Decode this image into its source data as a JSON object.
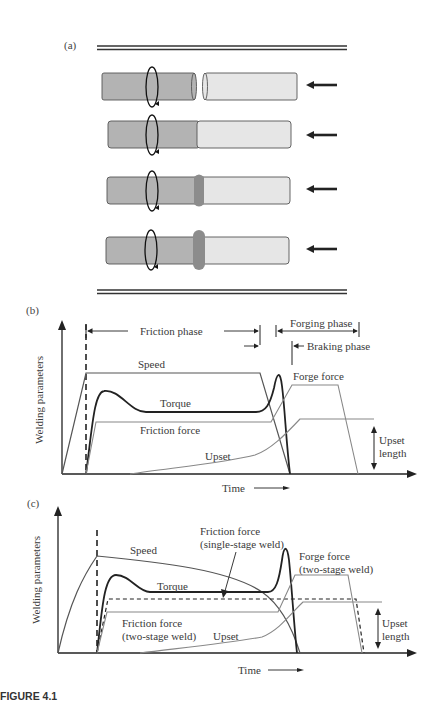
{
  "figure": {
    "caption": "FIGURE 4.1"
  },
  "panel_a": {
    "label": "(a)",
    "stages": [
      {
        "stage": 1,
        "description": "rods separated, left rotating, right pushed"
      },
      {
        "stage": 2,
        "description": "rods in contact"
      },
      {
        "stage": 3,
        "description": "flash forming at interface"
      },
      {
        "stage": 4,
        "description": "larger flash at interface"
      }
    ],
    "colors": {
      "rotating_rod": "#b3b3b3",
      "stationary_rod": "#e6e6e6",
      "flash": "#8c8c8c"
    }
  },
  "panel_b": {
    "label": "(b)",
    "ylabel": "Welding parameters",
    "xlabel": "Time",
    "phases": {
      "friction": "Friction phase",
      "forging": "Forging phase",
      "braking": "Braking phase"
    },
    "curves": {
      "speed": "Speed",
      "torque": "Torque",
      "friction_force": "Friction force",
      "forge_force": "Forge force",
      "upset": "Upset"
    },
    "upset_length": [
      "Upset",
      "length"
    ]
  },
  "panel_c": {
    "label": "(c)",
    "ylabel": "Welding parameters",
    "xlabel": "Time",
    "curves": {
      "speed": "Speed",
      "torque": "Torque",
      "upset": "Upset",
      "friction_force_single": [
        "Friction force",
        "(single-stage weld)"
      ],
      "forge_force_two": [
        "Forge force",
        "(two-stage weld)"
      ],
      "friction_force_two": [
        "Friction force",
        "(two-stage weld)"
      ]
    },
    "upset_length": [
      "Upset",
      "length"
    ]
  }
}
